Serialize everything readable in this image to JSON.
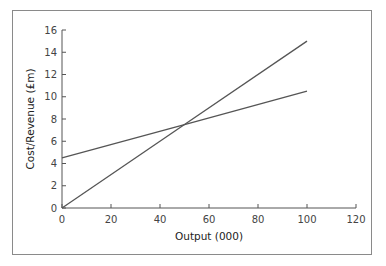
{
  "chart_data": {
    "type": "line",
    "title": "",
    "xlabel": "Output (000)",
    "ylabel": "Cost/Revenue (£m)",
    "xlim": [
      0,
      120
    ],
    "ylim": [
      0,
      16
    ],
    "x_ticks": [
      "0",
      "20",
      "40",
      "60",
      "80",
      "100",
      "120"
    ],
    "y_ticks": [
      "0",
      "2",
      "4",
      "6",
      "8",
      "10",
      "12",
      "14",
      "16"
    ],
    "grid": false,
    "legend": null,
    "series": [
      {
        "name": "Line 1 (starts at 4.5)",
        "x": [
          0,
          50,
          100
        ],
        "values": [
          4.5,
          7.5,
          10.5
        ],
        "color": "#555555"
      },
      {
        "name": "Line 2 (starts at 0)",
        "x": [
          0,
          50,
          100
        ],
        "values": [
          0,
          7.5,
          15
        ],
        "color": "#555555"
      }
    ],
    "annotations": [
      {
        "label": "intersection",
        "x": 50,
        "y": 7.5
      }
    ]
  }
}
